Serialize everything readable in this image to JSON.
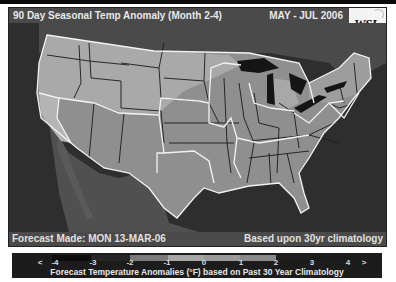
{
  "header": {
    "title": "90 Day Seasonal Temp Anomaly (Month 2-4)",
    "period": "MAY - JUL 2006",
    "logo": "WSI"
  },
  "footer": {
    "forecast_made": "Forecast Made: MON 13-MAR-06",
    "basis": "Based upon 30yr climatology"
  },
  "legend": {
    "caption": "Forecast Temperature Anomalies (°F) based on Past 30 Year Climatology",
    "ticks": [
      "<",
      "-4",
      "-3",
      "-2",
      "-1",
      "0",
      "1",
      "2",
      "3",
      "4",
      ">"
    ],
    "segments": [
      {
        "from": "-4",
        "to": "-3",
        "color": "#0c0c0c"
      },
      {
        "from": "-3",
        "to": "-2",
        "color": "#262626"
      },
      {
        "from": "-2",
        "to": "-1",
        "color": "#7a7a7a"
      },
      {
        "from": "-1",
        "to": "0",
        "color": "#a6a6a6"
      },
      {
        "from": "0",
        "to": "1",
        "color": "#9a9a9a"
      },
      {
        "from": "1",
        "to": "2",
        "color": "#8a8a8a"
      },
      {
        "from": "2",
        "to": "3",
        "color": "#1e1e1e"
      },
      {
        "from": "3",
        "to": "4",
        "color": "#1a1a1a"
      }
    ]
  },
  "map": {
    "region": "Contiguous United States",
    "anomaly_zones": [
      {
        "area": "Northwest, Northern Rockies, Northern Plains, Upper Michigan, Northeast interior",
        "shade": "light",
        "range_F": "-1 to 0",
        "color": "#a9a9a9"
      },
      {
        "area": "Southwest, Central & Southern Plains, Midwest, Southeast, Florida, Mid-Atlantic",
        "shade": "medium",
        "range_F": "0 to 1",
        "color": "#8f8f8f"
      },
      {
        "area": "California coast, Washington coast",
        "shade": "light",
        "range_F": "-1 to 0",
        "color": "#b4b4b4"
      }
    ],
    "colors": {
      "ocean": "#2e2e2e",
      "land_outside": "#4c4c4c",
      "great_lakes": "#151515",
      "state_border": "#1a1a1a",
      "region_border": "#f2f2f2"
    }
  }
}
